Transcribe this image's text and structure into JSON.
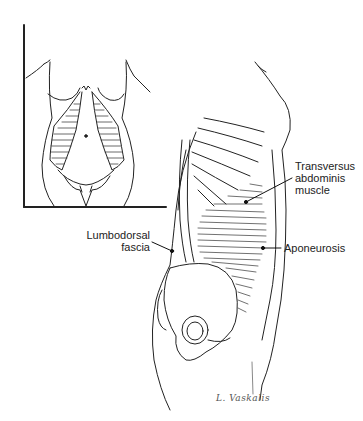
{
  "figure": {
    "inset": {
      "view": "anterior torso view"
    },
    "labels": {
      "transversus": {
        "line1": "Transversus",
        "line2": "abdominis",
        "line3": "muscle"
      },
      "aponeurosis": {
        "text": "Aponeurosis"
      },
      "lumbodorsal": {
        "line1": "Lumbodorsal",
        "line2": "fascia"
      }
    },
    "signature": "L. Vaskalis"
  }
}
